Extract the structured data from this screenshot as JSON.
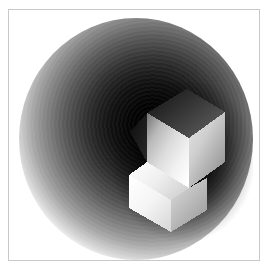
{
  "figure": {
    "title": "Shaded isometric solid on spherical backdrop",
    "width_px": 269,
    "height_px": 273,
    "background_color": "#ffffff",
    "frame": {
      "border_color": "#c9c9c9",
      "border_width_px": 1,
      "left_px": 8,
      "top_px": 9,
      "width_px": 252,
      "height_px": 252
    },
    "backdrop": {
      "shape": "sphere",
      "center_x_pct": 57,
      "center_y_pct": 44,
      "diameter_x_px": 234,
      "diameter_y_px": 242,
      "darkest_color": "#000000",
      "lightest_color": "#ffffff",
      "banding": "concentric-rings",
      "gradient_stops": [
        {
          "pos_pct": 0,
          "color": "#000000"
        },
        {
          "pos_pct": 29,
          "color": "#111111"
        },
        {
          "pos_pct": 47,
          "color": "#343434"
        },
        {
          "pos_pct": 61,
          "color": "#5a5a5a"
        },
        {
          "pos_pct": 73,
          "color": "#828282"
        },
        {
          "pos_pct": 84,
          "color": "#ababab"
        },
        {
          "pos_pct": 92,
          "color": "#d1d1d1"
        },
        {
          "pos_pct": 97,
          "color": "#eeeeee"
        },
        {
          "pos_pct": 100,
          "color": "#ffffff"
        }
      ]
    },
    "solid": {
      "name": "L-shaped voxel block",
      "projection": "isometric",
      "facets": [
        {
          "name": "top-face",
          "shade": "mid-dark",
          "color": "#3a3a3a"
        },
        {
          "name": "left-face",
          "shade": "bright",
          "color": "#f2f2f2"
        },
        {
          "name": "right-face",
          "shade": "mid",
          "color": "#c2c2c2"
        },
        {
          "name": "step-top-face",
          "shade": "bright",
          "color": "#ededed"
        },
        {
          "name": "step-front-face",
          "shade": "bright",
          "color": "#f6f6f6"
        },
        {
          "name": "lower-left-face",
          "shade": "bright",
          "color": "#fafafa"
        },
        {
          "name": "lower-right-face",
          "shade": "mid",
          "color": "#bdbdbd"
        }
      ],
      "bounds": {
        "left_px": 104,
        "top_px": 74,
        "width_px": 140,
        "height_px": 166
      }
    }
  }
}
